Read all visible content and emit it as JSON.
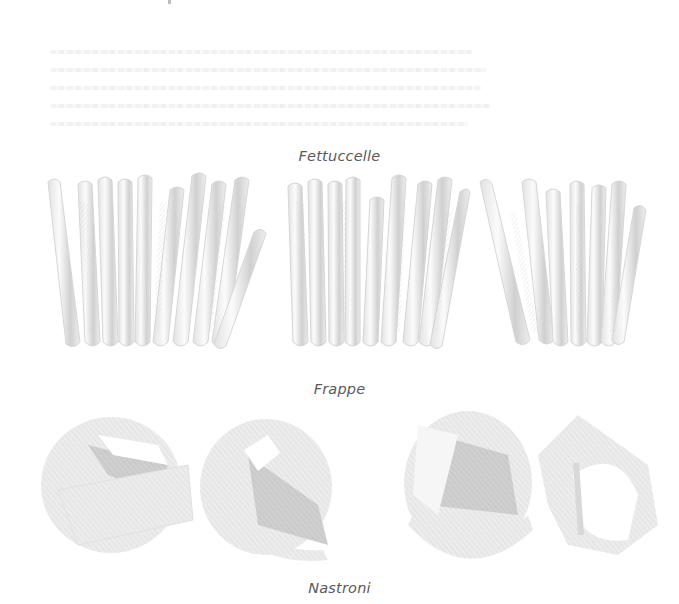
{
  "page": {
    "background": "#ffffff",
    "text_color": "#5a5a5a",
    "illustration_shade": "#bcbcbc"
  },
  "bleed_through_text": {
    "line_count": 5,
    "legible": false
  },
  "sections": [
    {
      "caption": "Fettuccelle",
      "illustration": "fettuccelle-cluster-icon",
      "groups": 3,
      "ribbon_counts": [
        10,
        9,
        7
      ]
    },
    {
      "caption": "Frappe",
      "illustration": "frappe-ribbon-icon",
      "pieces": 4
    },
    {
      "caption": "Nastroni"
    }
  ]
}
